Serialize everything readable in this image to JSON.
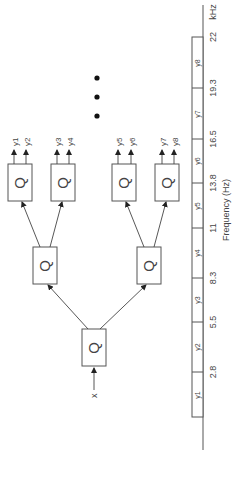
{
  "diagram": {
    "orientation": "rotated-90-ccw",
    "input_label": "x",
    "node_symbol": "Q",
    "levels": [
      {
        "level": 1,
        "nodes": [
          "Q"
        ]
      },
      {
        "level": 2,
        "nodes": [
          "Q",
          "Q"
        ]
      },
      {
        "level": 3,
        "nodes": [
          "Q",
          "Q",
          "Q",
          "Q"
        ]
      }
    ],
    "outputs": [
      "y1",
      "y2",
      "y3",
      "y4",
      "y5",
      "y6",
      "y7",
      "y8"
    ],
    "ellipsis": "•••"
  },
  "frequency_axis": {
    "label": "Frequency (Hz)",
    "unit_label": "kHz",
    "ticks": [
      "2.8",
      "5.5",
      "8.3",
      "11",
      "13.8",
      "16.5",
      "19.3",
      "22"
    ],
    "bands": [
      {
        "label": "y1",
        "sub": "1"
      },
      {
        "label": "y2",
        "sub": "2"
      },
      {
        "label": "y3",
        "sub": "3"
      },
      {
        "label": "y4",
        "sub": "4"
      },
      {
        "label": "y5",
        "sub": "5"
      },
      {
        "label": "y6",
        "sub": "6"
      },
      {
        "label": "y7",
        "sub": "7"
      },
      {
        "label": "y8",
        "sub": "8"
      }
    ]
  }
}
